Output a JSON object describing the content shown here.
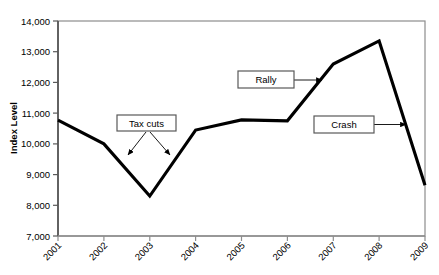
{
  "chart_data": {
    "type": "line",
    "title": "",
    "xlabel": "",
    "ylabel": "Index Level",
    "categories": [
      "2001",
      "2002",
      "2003",
      "2004",
      "2005",
      "2006",
      "2007",
      "2008",
      "2009"
    ],
    "values": [
      10770,
      10000,
      8300,
      10450,
      10780,
      10750,
      12600,
      13350,
      8650
    ],
    "series": [
      {
        "name": "Index Level",
        "values": [
          10770,
          10000,
          8300,
          10450,
          10780,
          10750,
          12600,
          13350,
          8650
        ]
      }
    ],
    "ylim": [
      7000,
      14000
    ],
    "ytick_labels": [
      "14,000",
      "13,000",
      "12,000",
      "11,000",
      "10,000",
      "9,000",
      "8,000",
      "7,000"
    ],
    "ytick_values": [
      14000,
      13000,
      12000,
      11000,
      10000,
      9000,
      8000,
      7000
    ],
    "xtick_labels": [
      "2001",
      "2002",
      "2003",
      "2004",
      "2005",
      "2006",
      "2007",
      "2008",
      "2009"
    ],
    "grid": false,
    "legend": "none",
    "line_color": "#000000",
    "border_color": "#808080",
    "background": "#ffffff",
    "annotations": [
      {
        "label": "Tax cuts",
        "arrows": 2,
        "points_to": [
          "2002-2003 decline",
          "2003-2004 recovery"
        ]
      },
      {
        "label": "Rally",
        "arrows": 1,
        "points_to": [
          "2006-2008 rise"
        ]
      },
      {
        "label": "Crash",
        "arrows": 1,
        "points_to": [
          "2008-2009 drop"
        ]
      }
    ]
  },
  "axes": {
    "y_title": "Index Level"
  },
  "annotations": {
    "tax_cuts": "Tax cuts",
    "rally": "Rally",
    "crash": "Crash"
  }
}
